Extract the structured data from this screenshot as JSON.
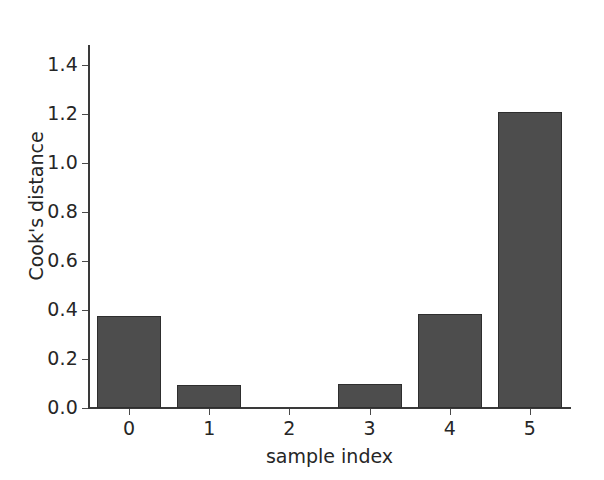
{
  "chart_data": {
    "type": "bar",
    "title": "",
    "subtitle": "",
    "xlabel": "sample index",
    "ylabel": "Cook's distance",
    "categories": [
      "0",
      "1",
      "2",
      "3",
      "4",
      "5"
    ],
    "values": [
      0.375,
      0.095,
      0.0,
      0.097,
      0.382,
      1.205
    ],
    "series": [
      {
        "name": "Cook's distance",
        "values": [
          0.375,
          0.095,
          0.0,
          0.097,
          0.382,
          1.205
        ]
      }
    ],
    "ylim": [
      0.0,
      1.48
    ],
    "xlim": [
      -0.5,
      5.5
    ],
    "ytick_labels": [
      "0.0",
      "0.2",
      "0.4",
      "0.6",
      "0.8",
      "1.0",
      "1.2",
      "1.4"
    ],
    "ytick_values": [
      0.0,
      0.2,
      0.4,
      0.6,
      0.8,
      1.0,
      1.2,
      1.4
    ],
    "xtick_labels": [
      "0",
      "1",
      "2",
      "3",
      "4",
      "5"
    ],
    "xtick_values": [
      0,
      1,
      2,
      3,
      4,
      5
    ],
    "grid": false,
    "legend": false,
    "legend_position": "none",
    "bar_color": "#4d4d4d",
    "bar_edge_color": "#2e2e2e",
    "axis_color": "#3a3a3a",
    "background_color": "#ffffff",
    "text_color": "#262626",
    "annotations": []
  }
}
